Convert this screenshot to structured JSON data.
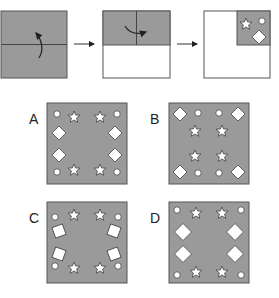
{
  "colors": {
    "paper": "#9a9a9a",
    "paper_dark": "#8e8e8e",
    "outline": "#555555",
    "shape_fill": "#ffffff",
    "shape_stroke": "#444444",
    "background": "#ffffff"
  },
  "fold_sequence": {
    "steps": [
      {
        "name": "step-1-full-sheet",
        "description": "full square paper with horizontal fold line and upward curved arrow"
      },
      {
        "name": "step-2-half-folded",
        "description": "top half shaded with vertical fold line and rightward curved arrow"
      },
      {
        "name": "step-3-quarter-cut",
        "description": "top-right quarter shaded with punched star, circle, diamond"
      }
    ],
    "cut_shapes": [
      "star",
      "circle",
      "diamond"
    ]
  },
  "options": [
    {
      "label": "A",
      "description": "circles at corners, stars top/bottom, diamonds left/right"
    },
    {
      "label": "B",
      "description": "diamonds at corners, circles top/bottom, stars inner"
    },
    {
      "label": "C",
      "description": "circles at corners, stars top/bottom, tilted squares left/right"
    },
    {
      "label": "D",
      "description": "circles at corners, stars top/bottom, large diamonds left/right"
    }
  ]
}
